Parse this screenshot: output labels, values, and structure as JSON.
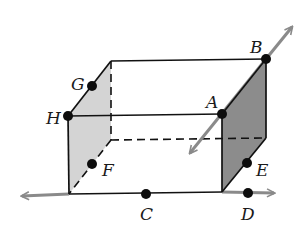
{
  "diagram": {
    "type": "rectangular prism with points and lines",
    "colors": {
      "edge": "#111111",
      "line": "#8a8a8a",
      "left_face": "#d4d4d4",
      "right_face": "#8c8c8c",
      "point": "#0d0d0d"
    },
    "points": [
      {
        "label": "A",
        "x": 222,
        "y": 114,
        "lx": 206,
        "ly": 108
      },
      {
        "label": "B",
        "x": 266,
        "y": 59,
        "lx": 250,
        "ly": 53
      },
      {
        "label": "C",
        "x": 146,
        "y": 194,
        "lx": 140,
        "ly": 220
      },
      {
        "label": "D",
        "x": 248,
        "y": 193,
        "lx": 241,
        "ly": 220
      },
      {
        "label": "E",
        "x": 247,
        "y": 163,
        "lx": 256,
        "ly": 176
      },
      {
        "label": "F",
        "x": 92,
        "y": 164,
        "lx": 102,
        "ly": 176
      },
      {
        "label": "G",
        "x": 92,
        "y": 86,
        "lx": 71,
        "ly": 90
      },
      {
        "label": "H",
        "x": 68,
        "y": 116,
        "lx": 46,
        "ly": 124
      }
    ],
    "lines": [
      {
        "name": "line-AB",
        "through": [
          "A",
          "B"
        ]
      },
      {
        "name": "line-CD",
        "through": [
          "C",
          "D"
        ]
      }
    ]
  }
}
